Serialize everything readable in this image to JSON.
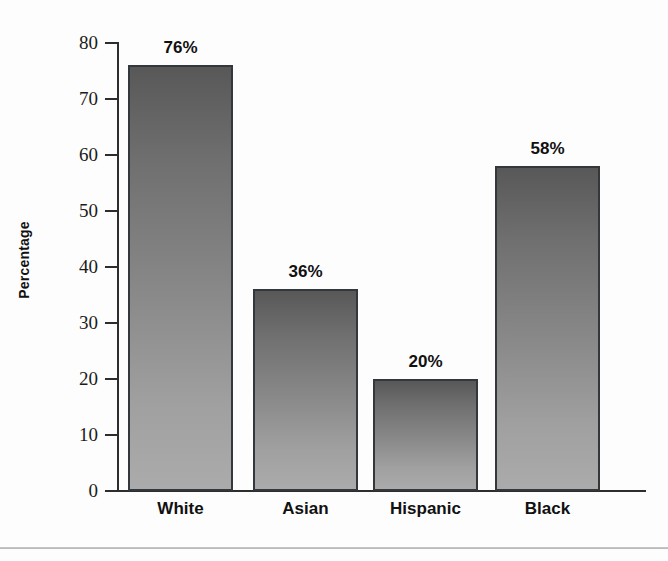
{
  "chart_data": {
    "type": "bar",
    "title": "",
    "subtitle": "",
    "xlabel": "",
    "ylabel": "Percentage",
    "categories": [
      "White",
      "Asian",
      "Hispanic",
      "Black"
    ],
    "values": [
      76,
      36,
      20,
      58
    ],
    "data_labels": [
      "76%",
      "36%",
      "20%",
      "58%"
    ],
    "ylim": [
      0,
      80
    ],
    "ytick_labels": [
      "80",
      "70",
      "60",
      "50",
      "40",
      "30",
      "20",
      "10",
      "0"
    ],
    "ytick_values": [
      80,
      70,
      60,
      50,
      40,
      30,
      20,
      10,
      0
    ],
    "grid": false,
    "legend": false,
    "legend_position": "none",
    "series": [
      {
        "name": "Percentage",
        "values": [
          76,
          36,
          20,
          58
        ]
      }
    ],
    "colors": {
      "bar_gradient_top": "#585858",
      "bar_gradient_bottom": "#ababab",
      "bar_border": "#33383c",
      "axis": "#2d2d2d",
      "text": "#111111",
      "background": "#fdfdfd",
      "divider": "#c2c2c2"
    }
  },
  "figure": {
    "divider_name": "page-rule"
  }
}
